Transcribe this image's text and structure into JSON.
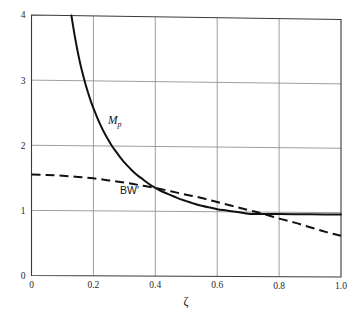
{
  "chart_data": {
    "type": "line",
    "title": "",
    "subtitle": "",
    "xlabel": "ζ",
    "ylabel": "",
    "xlim": [
      0,
      1.0
    ],
    "ylim": [
      0,
      4
    ],
    "grid": true,
    "legend_position": "inline-annotations",
    "xticks": [
      0,
      0.2,
      0.4,
      0.6,
      0.8,
      1.0
    ],
    "xtick_labels": [
      "0",
      "0.2",
      "0.4",
      "0.6",
      "0.8",
      "1.0"
    ],
    "yticks": [
      0,
      1,
      2,
      3,
      4
    ],
    "ytick_labels": [
      "0",
      "1",
      "2",
      "3",
      "4"
    ],
    "annotations": [
      {
        "text": "M",
        "sub": "p",
        "x": 0.27,
        "y": 2.45,
        "style": "italic-serif"
      },
      {
        "text": "BW′",
        "sub": "",
        "x": 0.31,
        "y": 1.24,
        "style": "upright-sans"
      }
    ],
    "series": [
      {
        "name": "Mp",
        "label": "M_p",
        "style": "solid",
        "color": "#111111",
        "x": [
          0.129,
          0.14,
          0.15,
          0.16,
          0.175,
          0.19,
          0.2,
          0.22,
          0.24,
          0.26,
          0.28,
          0.3,
          0.32,
          0.34,
          0.36,
          0.38,
          0.4,
          0.42,
          0.44,
          0.46,
          0.48,
          0.5,
          0.52,
          0.55,
          0.58,
          0.6,
          0.63,
          0.66,
          0.69,
          0.707,
          0.75,
          0.8,
          0.85,
          0.9,
          0.95,
          1.0
        ],
        "y": [
          4.0,
          3.68,
          3.43,
          3.21,
          2.94,
          2.71,
          2.58,
          2.35,
          2.16,
          2.0,
          1.87,
          1.75,
          1.65,
          1.56,
          1.49,
          1.42,
          1.36,
          1.31,
          1.27,
          1.23,
          1.19,
          1.16,
          1.13,
          1.09,
          1.06,
          1.04,
          1.02,
          1.0,
          0.98,
          0.97,
          0.97,
          0.97,
          0.97,
          0.97,
          0.97,
          0.97
        ]
      },
      {
        "name": "BW'",
        "label": "BW′",
        "style": "dashed",
        "color": "#111111",
        "x": [
          0,
          0.05,
          0.1,
          0.15,
          0.2,
          0.25,
          0.3,
          0.35,
          0.4,
          0.45,
          0.5,
          0.55,
          0.6,
          0.65,
          0.7,
          0.75,
          0.8,
          0.85,
          0.9,
          0.95,
          1.0
        ],
        "y": [
          1.55,
          1.545,
          1.535,
          1.52,
          1.5,
          1.47,
          1.44,
          1.4,
          1.36,
          1.31,
          1.26,
          1.21,
          1.15,
          1.09,
          1.03,
          0.97,
          0.9,
          0.84,
          0.77,
          0.7,
          0.64
        ]
      }
    ]
  },
  "axes": {
    "x_axis_label": "ζ",
    "x_tick_labels": [
      "0",
      "0.2",
      "0.4",
      "0.6",
      "0.8",
      "1.0"
    ],
    "y_tick_labels": [
      "0",
      "1",
      "2",
      "3",
      "4"
    ]
  },
  "labels": {
    "mp_main": "M",
    "mp_sub": "p",
    "bw_text": "BW′"
  }
}
